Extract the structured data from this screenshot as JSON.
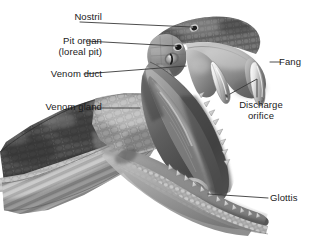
{
  "figure": {
    "style": "grayscale-airbrush-illustration",
    "background_color": "#ffffff",
    "leader_line_color": "#3a3a3a",
    "text_color": "#1a1a1a"
  },
  "labels": {
    "nostril": "Nostril",
    "pit_organ_line1": "Pit organ",
    "pit_organ_line2": "(loreal pit)",
    "venom_duct": "Venom duct",
    "venom_gland": "Venom gland",
    "fang": "Fang",
    "discharge_line1": "Discharge",
    "discharge_line2": "orifice",
    "glottis": "Glottis"
  }
}
